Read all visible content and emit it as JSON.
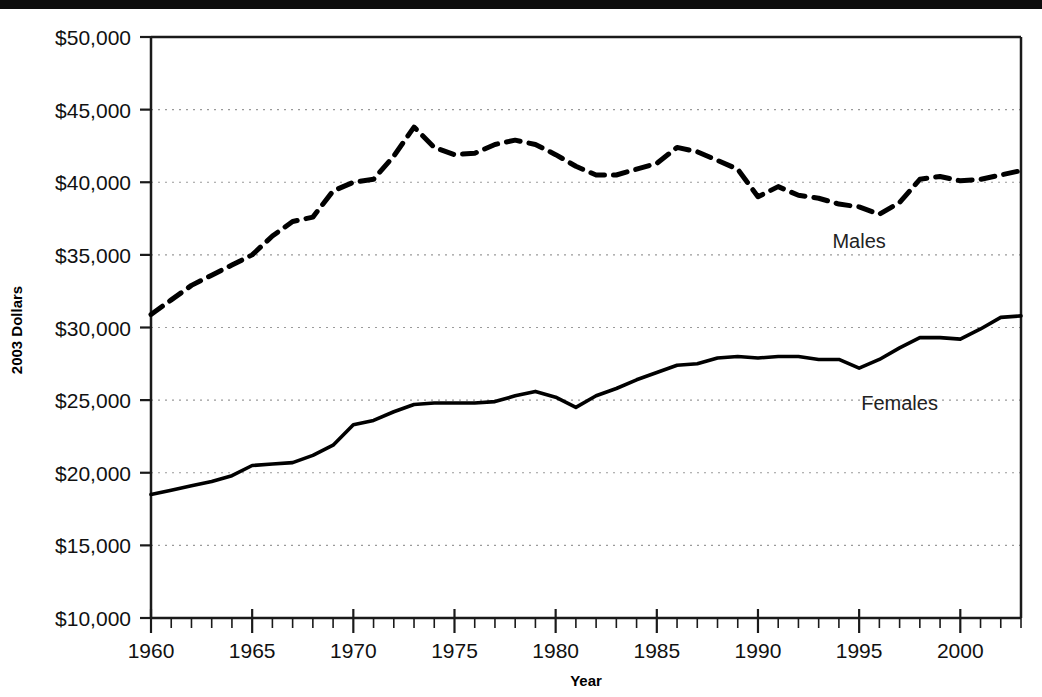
{
  "chart_data": {
    "type": "line",
    "title": "",
    "subtitle": "",
    "xlabel": "Year",
    "ylabel": "2003 Dollars",
    "xlim": [
      1960,
      2003
    ],
    "ylim": [
      10000,
      50000
    ],
    "grid": true,
    "grid_axis": "y",
    "legend_position": "inline-annotation",
    "y_ticks": [
      10000,
      15000,
      20000,
      25000,
      30000,
      35000,
      40000,
      45000,
      50000
    ],
    "y_tick_labels": [
      "$10,000",
      "$15,000",
      "$20,000",
      "$25,000",
      "$30,000",
      "$35,000",
      "$40,000",
      "$45,000",
      "$50,000"
    ],
    "x_ticks": [
      1960,
      1965,
      1970,
      1975,
      1980,
      1985,
      1990,
      1995,
      2000
    ],
    "x_tick_labels": [
      "1960",
      "1965",
      "1970",
      "1975",
      "1980",
      "1985",
      "1990",
      "1995",
      "2000"
    ],
    "x_minor_tick_step": 1,
    "x": [
      1960,
      1961,
      1962,
      1963,
      1964,
      1965,
      1966,
      1967,
      1968,
      1969,
      1970,
      1971,
      1972,
      1973,
      1974,
      1975,
      1976,
      1977,
      1978,
      1979,
      1980,
      1981,
      1982,
      1983,
      1984,
      1985,
      1986,
      1987,
      1988,
      1989,
      1990,
      1991,
      1992,
      1993,
      1994,
      1995,
      1996,
      1997,
      1998,
      1999,
      2000,
      2001,
      2002,
      2003
    ],
    "series": [
      {
        "name": "Males",
        "label": "Males",
        "style": "dashed",
        "color": "#000000",
        "values": [
          30900,
          31900,
          32900,
          33600,
          34300,
          35000,
          36300,
          37300,
          37600,
          39400,
          40000,
          40200,
          41800,
          43800,
          42400,
          41900,
          42000,
          42600,
          42900,
          42600,
          41900,
          41100,
          40500,
          40500,
          40900,
          41300,
          42400,
          42100,
          41500,
          40900,
          39000,
          39700,
          39100,
          38900,
          38500,
          38300,
          37800,
          38600,
          40200,
          40400,
          40100,
          40200,
          40500,
          40800
        ]
      },
      {
        "name": "Females",
        "label": "Females",
        "style": "solid",
        "color": "#000000",
        "values": [
          18500,
          18800,
          19100,
          19400,
          19800,
          20500,
          20600,
          20700,
          21200,
          21900,
          23300,
          23600,
          24200,
          24700,
          24800,
          24800,
          24800,
          24900,
          25300,
          25600,
          25200,
          24500,
          25300,
          25800,
          26400,
          26900,
          27400,
          27500,
          27900,
          28000,
          27900,
          28000,
          28000,
          27800,
          27800,
          27200,
          27800,
          28600,
          29300,
          29300,
          29200,
          29900,
          30700,
          30800
        ]
      }
    ],
    "annotations": [
      {
        "text": "Males",
        "x": 1995,
        "y": 35500
      },
      {
        "text": "Females",
        "x": 1997,
        "y": 24300
      }
    ]
  },
  "axes": {
    "y_title": "2003 Dollars",
    "x_title": "Year"
  }
}
